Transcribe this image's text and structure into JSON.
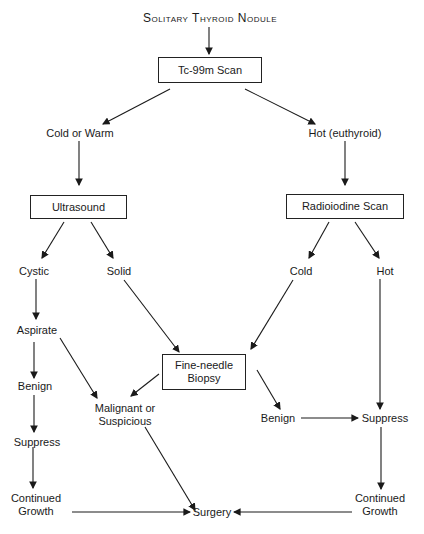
{
  "title": "Solitary Thyroid Nodule",
  "boxes": {
    "tc99m": "Tc-99m Scan",
    "ultrasound": "Ultrasound",
    "radioiodine": "Radioiodine Scan",
    "fna_line1": "Fine-needle",
    "fna_line2": "Biopsy"
  },
  "labels": {
    "cold_warm": "Cold or Warm",
    "hot_euthyroid": "Hot (euthyroid)",
    "cystic": "Cystic",
    "solid": "Solid",
    "cold": "Cold",
    "hot": "Hot",
    "aspirate": "Aspirate",
    "benign_left": "Benign",
    "suppress_left": "Suppress",
    "continued_left_1": "Continued",
    "continued_left_2": "Growth",
    "malignant_1": "Malignant or",
    "malignant_2": "Suspicious",
    "benign_right": "Benign",
    "suppress_right": "Suppress",
    "continued_right_1": "Continued",
    "continued_right_2": "Growth",
    "surgery": "Surgery"
  }
}
